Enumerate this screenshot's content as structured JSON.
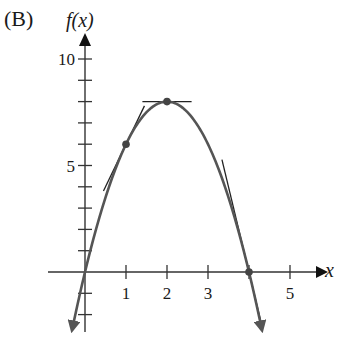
{
  "panel_label": "(B)",
  "chart_data": {
    "type": "line",
    "title": "",
    "xlabel": "x",
    "ylabel": "f(x)",
    "function": "f(x) = 2x(4 - x) = -2x^2 + 8x",
    "xlim": [
      -0.4,
      5.9
    ],
    "ylim": [
      -2.8,
      11.3
    ],
    "x_ticks": [
      1,
      2,
      3,
      4,
      5
    ],
    "x_tick_labels": [
      "1",
      "2",
      "3",
      "",
      "5"
    ],
    "y_ticks": [
      -2,
      -1,
      1,
      2,
      3,
      4,
      5,
      6,
      7,
      8,
      9,
      10
    ],
    "y_tick_labels": {
      "5": "5",
      "10": "10"
    },
    "grid": false,
    "legend": null,
    "series": [
      {
        "name": "f(x)",
        "x": [
          -0.3,
          0,
          0.5,
          1,
          1.5,
          2,
          2.5,
          3,
          3.5,
          4,
          4.3
        ],
        "values": [
          -2.58,
          0,
          3.5,
          6,
          7.5,
          8,
          7.5,
          6,
          3.5,
          0,
          -2.58
        ],
        "arrows_at_ends": true
      }
    ],
    "points": [
      {
        "x": 0,
        "y": 0
      },
      {
        "x": 1,
        "y": 6
      },
      {
        "x": 2,
        "y": 8
      },
      {
        "x": 4,
        "y": 0
      }
    ],
    "tangent_lines": [
      {
        "at_x": 1,
        "slope": 4,
        "x_range": [
          0.45,
          1.45
        ]
      },
      {
        "at_x": 2,
        "slope": 0,
        "x_range": [
          1.4,
          2.6
        ]
      },
      {
        "at_x": 4,
        "slope": -8,
        "x_range": [
          3.34,
          4.32
        ]
      }
    ]
  }
}
